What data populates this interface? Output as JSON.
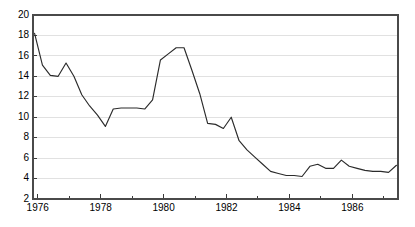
{
  "chart_data": {
    "type": "line",
    "title": "",
    "subtitle": "",
    "xlabel": "",
    "ylabel": "",
    "grid": true,
    "legend": "none",
    "xlim": [
      1975.85,
      1987.45
    ],
    "ylim": [
      2,
      20
    ],
    "y_ticks": [
      2,
      4,
      6,
      8,
      10,
      12,
      14,
      16,
      18,
      20
    ],
    "y_tick_labels": [
      "2",
      "4",
      "6",
      "8",
      "10",
      "12",
      "14",
      "16",
      "18",
      "20"
    ],
    "x_ticks_major": [
      1976,
      1978,
      1980,
      1982,
      1984,
      1986
    ],
    "x_tick_labels": [
      "1976",
      "1978",
      "1980",
      "1982",
      "1984",
      "1986"
    ],
    "x_ticks_minor": [
      1977,
      1979,
      1981,
      1983,
      1985,
      1987
    ],
    "line_color": "#2b2b2b",
    "grid_color": "#d9d9d9",
    "axis_color": "#4a4a4a",
    "background_color": "#ffffff",
    "series": [
      {
        "name": "series-1",
        "x": [
          1975.9,
          1976.15,
          1976.4,
          1976.65,
          1976.9,
          1977.15,
          1977.4,
          1977.65,
          1977.9,
          1978.15,
          1978.4,
          1978.65,
          1978.9,
          1979.15,
          1979.4,
          1979.65,
          1979.9,
          1980.15,
          1980.4,
          1980.65,
          1980.9,
          1981.15,
          1981.4,
          1981.65,
          1981.9,
          1982.15,
          1982.4,
          1982.65,
          1982.9,
          1983.15,
          1983.4,
          1983.65,
          1983.9,
          1984.15,
          1984.4,
          1984.65,
          1984.9,
          1985.15,
          1985.4,
          1985.65,
          1985.9,
          1986.15,
          1986.4,
          1986.65,
          1986.9,
          1987.15,
          1987.4
        ],
        "y": [
          18.2,
          15.1,
          14.1,
          14.0,
          15.3,
          14.0,
          12.2,
          11.1,
          10.2,
          9.1,
          10.8,
          10.9,
          10.9,
          10.9,
          10.8,
          11.7,
          15.6,
          16.2,
          16.8,
          16.8,
          14.6,
          12.3,
          9.4,
          9.3,
          8.9,
          10.0,
          7.7,
          6.8,
          6.1,
          5.4,
          4.7,
          4.5,
          4.3,
          4.3,
          4.2,
          5.2,
          5.4,
          5.0,
          5.0,
          5.8,
          5.2,
          5.0,
          4.8,
          4.7,
          4.7,
          4.6,
          5.3
        ]
      }
    ]
  },
  "plot_geometry": {
    "left": 33,
    "right": 398,
    "top": 15,
    "bottom": 199
  }
}
